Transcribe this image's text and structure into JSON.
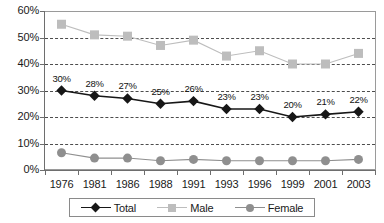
{
  "chart_data": {
    "type": "line",
    "title": "",
    "subtitle": "",
    "xlabel": "",
    "ylabel": "",
    "categories": [
      "1976",
      "1981",
      "1986",
      "1988",
      "1991",
      "1993",
      "1996",
      "1999",
      "2001",
      "2003"
    ],
    "ylim": [
      0,
      60
    ],
    "ytick_labels": [
      "0%",
      "10%",
      "20%",
      "30%",
      "40%",
      "50%",
      "60%"
    ],
    "ytick_values": [
      0,
      10,
      20,
      30,
      40,
      50,
      60
    ],
    "grid": "horizontal-dashed",
    "legend_position": "bottom",
    "series": [
      {
        "name": "Total",
        "marker": "diamond",
        "color": "#171717",
        "values": [
          30,
          28,
          27,
          25,
          26,
          23,
          23,
          20,
          21,
          22
        ],
        "labels": [
          "30%",
          "28%",
          "27%",
          "25%",
          "26%",
          "23%",
          "23%",
          "20%",
          "21%",
          "22%"
        ],
        "labels_shown": true
      },
      {
        "name": "Male",
        "marker": "square",
        "color": "#bdbdbd",
        "values": [
          55,
          51,
          50.5,
          47,
          49,
          43,
          45,
          40,
          40,
          44
        ],
        "labels": [],
        "labels_shown": false
      },
      {
        "name": "Female",
        "marker": "circle",
        "color": "#8f8f8f",
        "values": [
          6.5,
          4.5,
          4.5,
          3.5,
          4,
          3.5,
          3.5,
          3.5,
          3.5,
          4
        ],
        "labels": [],
        "labels_shown": false
      }
    ]
  },
  "legend": {
    "items": [
      {
        "label": "Total",
        "marker": "diamond"
      },
      {
        "label": "Male",
        "marker": "square"
      },
      {
        "label": "Female",
        "marker": "circle"
      }
    ]
  },
  "colors": {
    "total": "#171717",
    "male": "#bdbdbd",
    "female": "#8f8f8f",
    "gridline": "#4d4d4d",
    "axis": "#6e6e6e",
    "background": "#ffffff"
  }
}
